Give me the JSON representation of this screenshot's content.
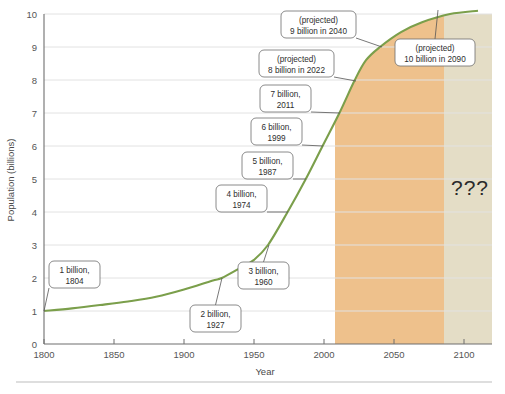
{
  "chart_data": {
    "type": "line",
    "title": "",
    "xlabel": "Year",
    "ylabel": "Population (billions)",
    "xlim": [
      1800,
      2120
    ],
    "ylim": [
      0,
      10
    ],
    "xticks": [
      1800,
      1850,
      1900,
      1950,
      2000,
      2050,
      2100
    ],
    "xtick_labels": [
      "1800",
      "1850",
      "1900",
      "1950",
      "2000",
      "2050",
      "2100"
    ],
    "yticks": [
      0,
      1,
      2,
      3,
      4,
      5,
      6,
      7,
      8,
      9,
      10
    ],
    "ytick_labels": [
      "0",
      "1",
      "2",
      "3",
      "4",
      "5",
      "6",
      "7",
      "8",
      "9",
      "10"
    ],
    "grid": true,
    "legend": "none",
    "series": [
      {
        "name": "World population",
        "color": "#7b9f4b",
        "x": [
          1800,
          1820,
          1840,
          1860,
          1880,
          1900,
          1920,
          1927,
          1940,
          1950,
          1960,
          1974,
          1987,
          1999,
          2011,
          2022,
          2030,
          2040,
          2055,
          2070,
          2090,
          2110
        ],
        "y": [
          1.0,
          1.08,
          1.18,
          1.29,
          1.43,
          1.65,
          1.92,
          2.0,
          2.3,
          2.55,
          3.0,
          4.0,
          5.0,
          6.0,
          7.0,
          8.0,
          8.6,
          9.0,
          9.45,
          9.75,
          10.0,
          10.1
        ]
      }
    ],
    "shaded_regions": [
      {
        "name": "projection-band",
        "from": 2008,
        "to": 2090,
        "color": "#eec18c"
      },
      {
        "name": "unknown-band",
        "from": 2090,
        "to": 2120,
        "color": "#e4ddc6"
      }
    ],
    "annotations": [
      {
        "name": "milestone-1-billion",
        "lines": [
          "1 billion,",
          "1804"
        ],
        "box_x": 49,
        "box_y": 261,
        "box_w": 51,
        "box_h": 27,
        "point_x": 44,
        "point_y": 311
      },
      {
        "name": "milestone-2-billion",
        "lines": [
          "2 billion,",
          "1927"
        ],
        "box_x": 190,
        "box_y": 305,
        "box_w": 51,
        "box_h": 27,
        "point_x": 222,
        "point_y": 278
      },
      {
        "name": "milestone-3-billion",
        "lines": [
          "3 billion,",
          "1960"
        ],
        "box_x": 238,
        "box_y": 262,
        "box_w": 51,
        "box_h": 27,
        "point_x": 269,
        "point_y": 245
      },
      {
        "name": "milestone-4-billion",
        "lines": [
          "4 billion,",
          "1974"
        ],
        "box_x": 216,
        "box_y": 185,
        "box_w": 51,
        "box_h": 27,
        "point_x": 288,
        "point_y": 212
      },
      {
        "name": "milestone-5-billion",
        "lines": [
          "5 billion,",
          "1987"
        ],
        "box_x": 242,
        "box_y": 152,
        "box_w": 51,
        "box_h": 27,
        "point_x": 306,
        "point_y": 179
      },
      {
        "name": "milestone-6-billion",
        "lines": [
          "6 billion,",
          "1999"
        ],
        "box_x": 251,
        "box_y": 118,
        "box_w": 51,
        "box_h": 27,
        "point_x": 323,
        "point_y": 146
      },
      {
        "name": "milestone-7-billion",
        "lines": [
          "7 billion,",
          "2011"
        ],
        "box_x": 260,
        "box_y": 85,
        "box_w": 51,
        "box_h": 27,
        "point_x": 340,
        "point_y": 113
      },
      {
        "name": "projection-8-billion",
        "lines": [
          "(projected)",
          "8 billion in 2022"
        ],
        "box_x": 259,
        "box_y": 50,
        "box_w": 75,
        "box_h": 27,
        "point_x": 356,
        "point_y": 81
      },
      {
        "name": "projection-9-billion",
        "lines": [
          "(projected)",
          "9 billion in 2040"
        ],
        "box_x": 281,
        "box_y": 11,
        "box_w": 75,
        "box_h": 27,
        "point_x": 382,
        "point_y": 47
      },
      {
        "name": "projection-10-billion",
        "lines": [
          "(projected)",
          "10 billion in 2090"
        ],
        "box_x": 395,
        "box_y": 39,
        "box_w": 80,
        "box_h": 27,
        "point_x": 438,
        "point_y": 10
      }
    ],
    "unknown_marker": {
      "name": "question-marks",
      "text": "???",
      "x": 470,
      "y": 195
    }
  },
  "figure": {
    "plot_left": 44,
    "plot_right": 492,
    "plot_top": 14,
    "plot_bottom": 344
  }
}
